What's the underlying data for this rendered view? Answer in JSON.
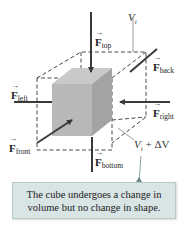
{
  "diagram": {
    "type": "bulk-stress-cube",
    "labels": {
      "top": "top",
      "back": "back",
      "left": "left",
      "right": "right",
      "front": "front",
      "bottom": "bottom",
      "force_symbol": "F",
      "initial_volume_symbol": "V",
      "initial_volume_sub": "i",
      "final_volume_suffix": " + ΔV"
    },
    "callout_text": "The cube undergoes a change in volume but no change in shape.",
    "colors": {
      "cube_front": "#b8b8b8",
      "cube_top": "#c9c9c9",
      "cube_side": "#a3a3a3",
      "arrows": "#3a3a3a",
      "dashed": "#333333",
      "callout_bg": "#d9e4e4",
      "callout_pointer": "#6e8a8a"
    }
  }
}
